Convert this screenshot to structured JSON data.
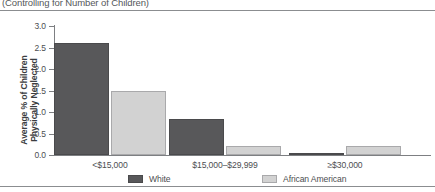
{
  "chart_data": {
    "type": "bar",
    "title": "(Controlling for Number of Children)",
    "xlabel": "",
    "ylabel": "Average % of Children Physically Neglected",
    "ylabel_line1": "Average % of Children",
    "ylabel_line2": "Physically Neglected",
    "categories": [
      "<$15,000",
      "$15,000–$29,999",
      "≥$30,000"
    ],
    "series": [
      {
        "name": "White",
        "color": "#58585a",
        "values": [
          2.6,
          0.83,
          0.03
        ]
      },
      {
        "name": "African American",
        "color": "#d2d2d2",
        "values": [
          1.5,
          0.2,
          0.2
        ]
      }
    ],
    "ylim": [
      0.0,
      3.0
    ],
    "ytick_values": [
      0.0,
      0.5,
      1.0,
      1.5,
      2.0,
      2.5,
      3.0
    ],
    "ytick_labels": [
      "0.0",
      "0.5",
      "1.0",
      "1.5",
      "2.0",
      "2.5",
      "3.0"
    ],
    "grid": false,
    "legend_position": "bottom"
  }
}
